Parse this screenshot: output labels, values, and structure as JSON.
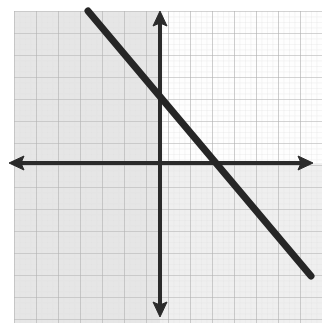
{
  "figure": {
    "kind": "coordinate-plane-graph",
    "width": 322,
    "height": 323,
    "background_color": "#ffffff",
    "caption_fragment": "y",
    "caption_note": "partially cropped handwritten characters at top edge"
  },
  "grid": {
    "cell_size_px": 22,
    "line_color": "#b6b6b6",
    "minor_line_color": "#d8d8d8",
    "shaded_fill_color": "#e4e4e4",
    "unshaded_fill_color": "#fbfbfb",
    "columns": 15,
    "rows": 15,
    "left_px": 14,
    "top_px": 11,
    "right_px": 322,
    "bottom_px": 323
  },
  "axes": {
    "color": "#2b2b2b",
    "stroke_width_px": 4,
    "origin_px": {
      "x": 160,
      "y": 163
    },
    "x_axis": {
      "label": "x-axis",
      "y_px": 163,
      "start_px": 10,
      "end_px": 312,
      "arrow_start": true,
      "arrow_end": true
    },
    "y_axis": {
      "label": "y-axis",
      "x_px": 160,
      "start_px": 12,
      "end_px": 316,
      "arrow_start": true,
      "arrow_end": true
    }
  },
  "chart_data": {
    "type": "line",
    "title": "",
    "xlabel": "x",
    "ylabel": "y",
    "grid": true,
    "legend_position": "none",
    "xlim": [
      -7,
      7
    ],
    "ylim": [
      -7,
      7
    ],
    "series": [
      {
        "name": "line",
        "slope": -1.2,
        "y_intercept": 2.7,
        "x_intercept": 2.5,
        "color": "#262626",
        "stroke_width_px": 7,
        "endpoints_px": [
          {
            "x": 88,
            "y": 11
          },
          {
            "x": 311,
            "y": 276
          }
        ],
        "endpoints_units": [
          {
            "x": -3.27,
            "y": 6.91
          },
          {
            "x": 6.86,
            "y": -5.14
          }
        ]
      }
    ]
  }
}
